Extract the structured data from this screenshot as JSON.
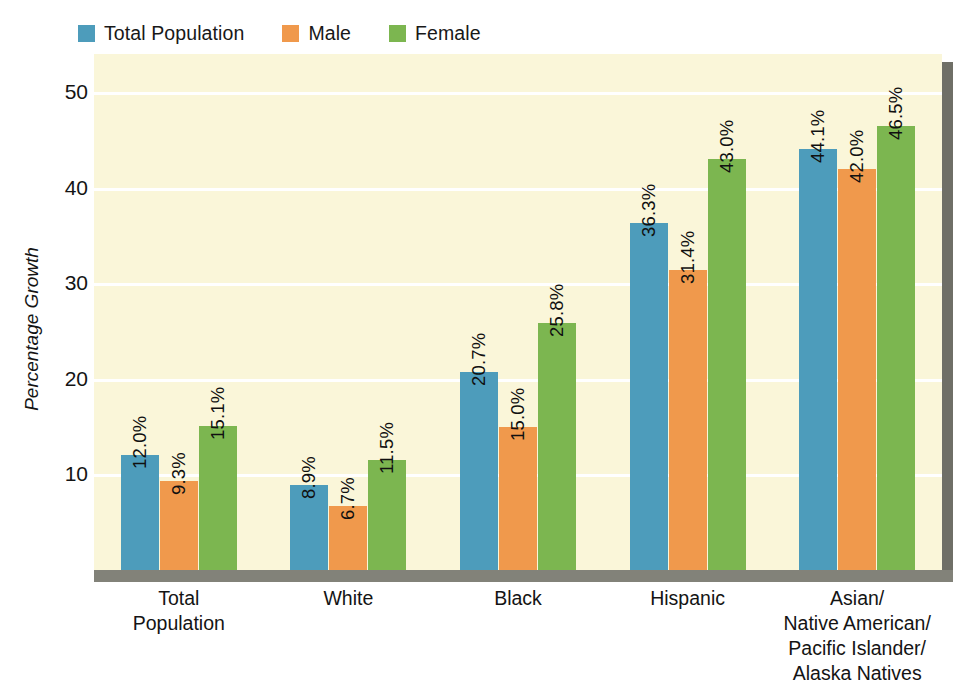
{
  "chart_data": {
    "type": "bar",
    "title": "",
    "subtitle": "",
    "xlabel": "",
    "ylabel": "Percentage Growth",
    "ylim": [
      0,
      54
    ],
    "yticks": [
      10,
      20,
      30,
      40,
      50
    ],
    "ytick_labels": [
      "10",
      "20",
      "30",
      "40",
      "50"
    ],
    "grid": true,
    "grid_axis": "y",
    "legend_position": "top-left",
    "value_label_format": "0.0%",
    "value_label_rotation": -90,
    "categories": [
      "Total\nPopulation",
      "White",
      "Black",
      "Hispanic",
      "Asian/\nNative American/\nPacific Islander/\nAlaska Natives"
    ],
    "category_lines": [
      [
        "Total",
        "Population"
      ],
      [
        "White"
      ],
      [
        "Black"
      ],
      [
        "Hispanic"
      ],
      [
        "Asian/",
        "Native American/",
        "Pacific Islander/",
        "Alaska Natives"
      ]
    ],
    "series": [
      {
        "name": "Total Population",
        "color": "#4d9cbb",
        "values": [
          12.0,
          8.9,
          20.7,
          36.3,
          44.1
        ],
        "labels": [
          "12.0%",
          "8.9%",
          "20.7%",
          "36.3%",
          "44.1%"
        ]
      },
      {
        "name": "Male",
        "color": "#f0994c",
        "values": [
          9.3,
          6.7,
          15.0,
          31.4,
          42.0
        ],
        "labels": [
          "9.3%",
          "6.7%",
          "15.0%",
          "31.4%",
          "42.0%"
        ]
      },
      {
        "name": "Female",
        "color": "#7cb650",
        "values": [
          15.1,
          11.5,
          25.8,
          43.0,
          46.5
        ],
        "labels": [
          "15.1%",
          "11.5%",
          "25.8%",
          "43.0%",
          "46.5%"
        ]
      }
    ]
  },
  "legend": {
    "items": [
      {
        "label": "Total Population",
        "color": "#4d9cbb"
      },
      {
        "label": "Male",
        "color": "#f0994c"
      },
      {
        "label": "Female",
        "color": "#7cb650"
      }
    ]
  },
  "axes": {
    "y_title": "Percentage Growth",
    "y_tick_labels": [
      "50",
      "40",
      "30",
      "20",
      "10"
    ]
  },
  "colors": {
    "plot_background": "#faf6d9",
    "gridline": "#ffffff",
    "shadow_right": "#6f6f67",
    "shadow_bottom": "#828279",
    "page_background": "#ffffff",
    "text": "#141414"
  }
}
